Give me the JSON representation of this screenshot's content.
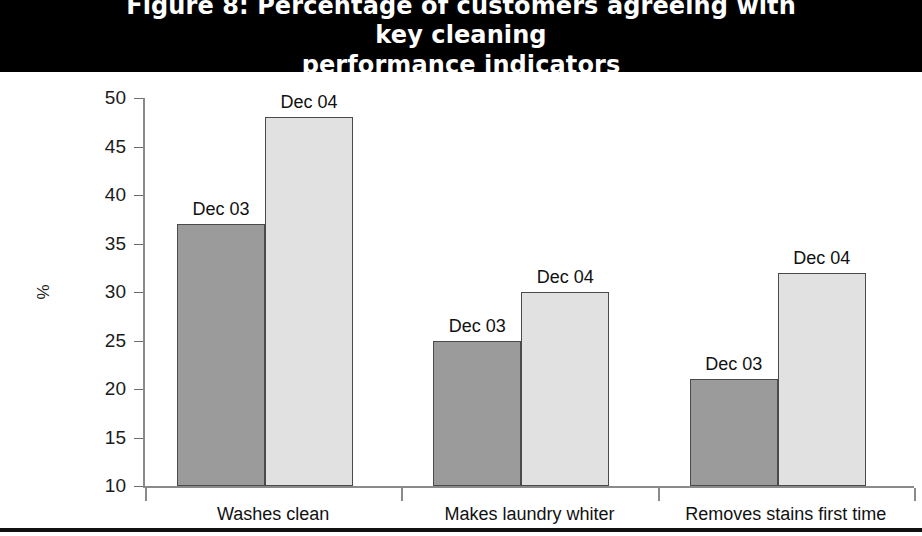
{
  "figure": {
    "title": "Figure 8: Percentage of customers agreeing with key cleaning performance indicators",
    "title_line1": "Figure 8: Percentage of customers agreeing with key cleaning",
    "title_line2": "performance indicators"
  },
  "chart_data": {
    "type": "bar",
    "title": "Figure 8: Percentage of customers agreeing with key cleaning performance indicators",
    "xlabel": "",
    "ylabel": "%",
    "ylim": [
      10,
      50
    ],
    "yticks": [
      10,
      15,
      20,
      25,
      30,
      35,
      40,
      45,
      50
    ],
    "grid": false,
    "legend_position": "none",
    "categories": [
      "Washes clean",
      "Makes laundry whiter",
      "Removes stains first time"
    ],
    "series": [
      {
        "name": "Dec 03",
        "color": "#9b9b9b",
        "values": [
          37,
          25,
          21
        ]
      },
      {
        "name": "Dec 04",
        "color": "#e1e1e1",
        "values": [
          48,
          30,
          32
        ]
      }
    ],
    "annotations": [
      {
        "text": "Dec 03",
        "category": "Washes clean",
        "value": 37
      },
      {
        "text": "Dec 04",
        "category": "Washes clean",
        "value": 48
      },
      {
        "text": "Dec 03",
        "category": "Makes laundry whiter",
        "value": 25
      },
      {
        "text": "Dec 04",
        "category": "Makes laundry whiter",
        "value": 30
      },
      {
        "text": "Dec 03",
        "category": "Removes stains first time",
        "value": 21
      },
      {
        "text": "Dec 04",
        "category": "Removes stains first time",
        "value": 32
      }
    ]
  },
  "colors": {
    "banner_background": "#000000",
    "banner_text": "#ffffff",
    "series_dec03": "#9b9b9b",
    "series_dec04": "#e1e1e1",
    "bar_border": "#4a4a4a",
    "axis": "#8a8a8a",
    "bottom_rule": "#111111"
  }
}
